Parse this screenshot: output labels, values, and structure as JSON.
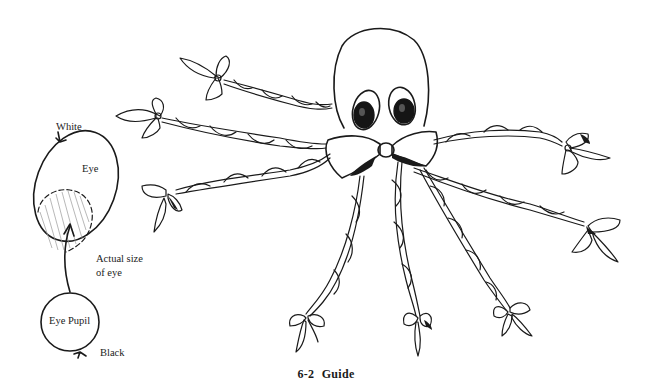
{
  "figure": {
    "caption": "6-2  Guide"
  },
  "eye_guide": {
    "labels": {
      "white": "White",
      "eye": "Eye",
      "actual_size_line1": "Actual size",
      "actual_size_line2": "of eye",
      "pupil": "Eye Pupil",
      "black": "Black"
    }
  },
  "octopus": {
    "tentacle_count": 8,
    "bow_count": 9,
    "colors": {
      "ink": "#1a1a1a",
      "pupil_fill": "#151515",
      "background": "#ffffff"
    }
  }
}
